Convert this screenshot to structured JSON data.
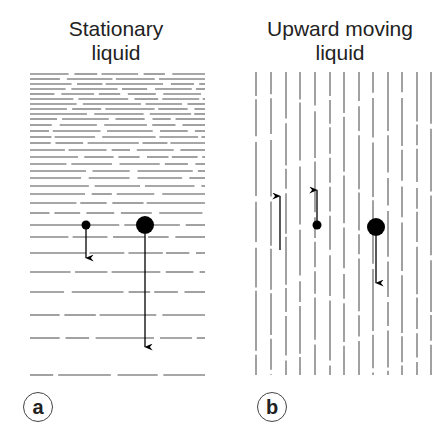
{
  "panels": [
    {
      "id": "a",
      "title_line1": "Stationary",
      "title_line2": "liquid",
      "label": "a",
      "orientation": "horizontal",
      "particles": [
        {
          "name": "small-particle",
          "cx": 86,
          "cy": 225,
          "r": 4.5,
          "arrow": {
            "direction": "down",
            "from": 229,
            "to": 258
          }
        },
        {
          "name": "large-particle",
          "cx": 145,
          "cy": 225,
          "r": 9,
          "arrow": {
            "direction": "down",
            "from": 234,
            "to": 347
          }
        }
      ]
    },
    {
      "id": "b",
      "title_line1": "Upward moving",
      "title_line2": "liquid",
      "label": "b",
      "orientation": "vertical",
      "flow_arrow": {
        "x": 280,
        "from": 250,
        "to": 196,
        "direction": "up"
      },
      "particles": [
        {
          "name": "small-particle",
          "cx": 317,
          "cy": 225,
          "r": 4.5,
          "arrow": {
            "direction": "up",
            "from": 221,
            "to": 190
          }
        },
        {
          "name": "large-particle",
          "cx": 376,
          "cy": 227,
          "r": 9,
          "arrow": {
            "direction": "down",
            "from": 236,
            "to": 283
          }
        }
      ]
    }
  ],
  "colors": {
    "streamline": "#8a8a8a",
    "particle": "#000000",
    "text": "#222222"
  }
}
